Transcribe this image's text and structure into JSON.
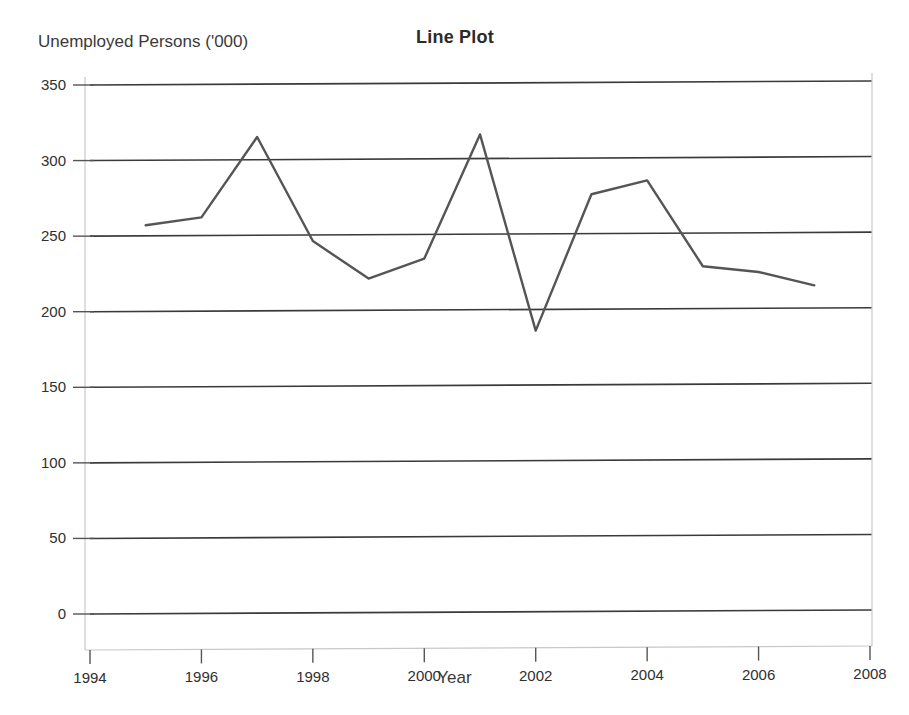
{
  "chart_data": {
    "type": "line",
    "title": "Line Plot",
    "xlabel": "Year",
    "ylabel": "Unemployed Persons ('000)",
    "x": [
      1995,
      1996,
      1997,
      1998,
      1999,
      2000,
      2001,
      2002,
      2003,
      2004,
      2005,
      2006,
      2007
    ],
    "values": [
      257,
      262,
      315,
      246,
      221,
      234,
      316,
      186,
      276,
      285,
      228,
      224,
      215
    ],
    "series": [
      {
        "name": "Unemployed Persons ('000)",
        "values": [
          257,
          262,
          315,
          246,
          221,
          234,
          316,
          186,
          276,
          285,
          228,
          224,
          215
        ]
      }
    ],
    "xlim": [
      1994,
      2008
    ],
    "ylim": [
      0,
      350
    ],
    "xticks": [
      1994,
      1996,
      1998,
      2000,
      2002,
      2004,
      2006,
      2008
    ],
    "xtick_labels": [
      "1994",
      "1996",
      "1998",
      "2000",
      "2002",
      "2004",
      "2006",
      "2008"
    ],
    "yticks": [
      0,
      50,
      100,
      150,
      200,
      250,
      300,
      350
    ],
    "ytick_labels": [
      "0",
      "50",
      "100",
      "150",
      "200",
      "250",
      "300",
      "350"
    ],
    "grid": true,
    "grid_axis": "y",
    "legend": false,
    "legend_position": "none",
    "line_color": "#555555",
    "grid_color": "#3a3a3a",
    "axis_color": "#c8c8c8",
    "background_color": "#ffffff"
  }
}
